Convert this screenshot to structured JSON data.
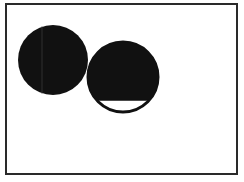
{
  "figure": {
    "background": "#ffffff",
    "frame": {
      "x": 6,
      "y": 4,
      "width": 231,
      "height": 170,
      "stroke": "#2a2a2a",
      "stroke_width": 2
    },
    "circles": [
      {
        "name": "left-circle",
        "cx": 53,
        "cy": 60,
        "r": 35,
        "fill": "#111111",
        "state": "fully-filled"
      },
      {
        "name": "right-circle",
        "cx": 123,
        "cy": 77,
        "r": 35,
        "fill": "#111111",
        "state": "filled-with-empty-bottom-segment",
        "empty_segment_top_y": 100,
        "outline_width": 3
      }
    ]
  }
}
